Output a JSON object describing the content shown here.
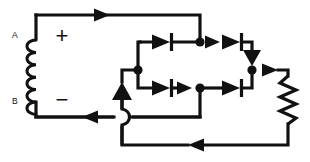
{
  "figure": {
    "kind": "circuit-schematic",
    "background_color": "#ffffff",
    "line_color": "#111111",
    "width": 310,
    "height": 162
  },
  "labels": {
    "terminal_a": "A",
    "terminal_b": "B",
    "polarity_positive": "+",
    "polarity_negative": "−"
  },
  "components": {
    "source": {
      "type": "coil",
      "name": "inductor-coil",
      "turns": 7
    },
    "load": {
      "type": "resistor",
      "name": "load-resistor",
      "zigzag_peaks": 5
    },
    "diodes": [
      {
        "id": "d1",
        "name": "diode-top-left",
        "direction": "right"
      },
      {
        "id": "d2",
        "name": "diode-top-right",
        "direction": "right"
      },
      {
        "id": "d3",
        "name": "diode-bottom-left",
        "direction": "right"
      },
      {
        "id": "d4",
        "name": "diode-bottom-right",
        "direction": "right"
      }
    ],
    "current_arrows": [
      {
        "id": "a1",
        "name": "current-arrow-top-wire",
        "direction": "right"
      },
      {
        "id": "a2",
        "name": "current-arrow-top-node",
        "direction": "right"
      },
      {
        "id": "a3",
        "name": "current-arrow-bottom-node",
        "direction": "right"
      },
      {
        "id": "a4",
        "name": "current-arrow-bridge-left-up",
        "direction": "up"
      },
      {
        "id": "a5",
        "name": "current-arrow-bridge-right-down",
        "direction": "down"
      },
      {
        "id": "a6",
        "name": "current-arrow-to-load",
        "direction": "right"
      },
      {
        "id": "a7",
        "name": "current-arrow-return-wire",
        "direction": "left"
      },
      {
        "id": "a8",
        "name": "current-arrow-source-return",
        "direction": "left"
      }
    ],
    "junction_dots": [
      {
        "id": "n1",
        "name": "junction-top-center"
      },
      {
        "id": "n2",
        "name": "junction-bridge-left"
      },
      {
        "id": "n3",
        "name": "junction-bridge-bottom-center"
      },
      {
        "id": "n4",
        "name": "junction-bridge-right"
      }
    ],
    "wire_crossings": [
      {
        "id": "x1",
        "name": "wire-hop-crossover"
      }
    ]
  }
}
